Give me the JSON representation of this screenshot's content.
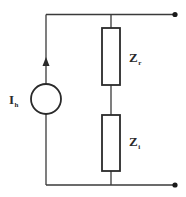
{
  "diagram": {
    "type": "circuit",
    "title": "",
    "source": {
      "kind": "current-source",
      "label_main": "I",
      "label_sub": "h",
      "direction": "up"
    },
    "impedances": [
      {
        "label_main": "Z",
        "label_sub": "r",
        "position": "upper"
      },
      {
        "label_main": "Z",
        "label_sub": "i",
        "position": "lower"
      }
    ],
    "terminals": [
      {
        "name": "top-terminal"
      },
      {
        "name": "bottom-terminal"
      }
    ],
    "colors": {
      "line": "#2a2a2a",
      "background": "#ffffff"
    }
  }
}
